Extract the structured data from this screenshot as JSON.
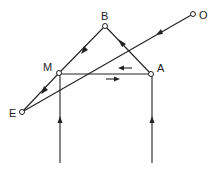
{
  "diagram": {
    "type": "signal-flow",
    "colors": {
      "ink": "#222222",
      "background": "#ffffff"
    },
    "nodes": [
      {
        "id": "B",
        "label": "B",
        "x": 105,
        "y": 26,
        "lx": 101,
        "ly": 20
      },
      {
        "id": "O",
        "label": "O",
        "x": 193,
        "y": 14,
        "lx": 199,
        "ly": 19
      },
      {
        "id": "M",
        "label": "M",
        "x": 59,
        "y": 73,
        "lx": 43,
        "ly": 71
      },
      {
        "id": "A",
        "label": "A",
        "x": 151,
        "y": 74,
        "lx": 157,
        "ly": 72
      },
      {
        "id": "E",
        "label": "E",
        "x": 22,
        "y": 112,
        "lx": 9,
        "ly": 117
      }
    ],
    "edges": [
      {
        "from": "A",
        "to": "B",
        "direction": "up-left"
      },
      {
        "from": "B",
        "to": "M",
        "direction": "down-left"
      },
      {
        "from": "M",
        "to": "E",
        "direction": "down-left"
      },
      {
        "from": "O",
        "to": "E",
        "direction": "down-left"
      },
      {
        "from": "A",
        "to": "M",
        "direction": "left",
        "parallel_arrow": "upper"
      },
      {
        "from": "M",
        "to": "A",
        "direction": "right",
        "parallel_arrow": "lower"
      },
      {
        "from": "bottom-left",
        "to": "M",
        "direction": "up"
      },
      {
        "from": "bottom-right",
        "to": "A",
        "direction": "up"
      }
    ]
  }
}
